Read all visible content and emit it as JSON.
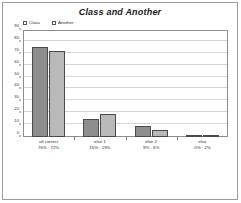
{
  "chart_data": {
    "type": "bar",
    "title": "Class and Another",
    "xlabel": "",
    "ylabel": "",
    "ylim": [
      0,
      90
    ],
    "ytick_step": 10,
    "yticks": [
      "0",
      "10",
      "20",
      "30",
      "40",
      "50",
      "60",
      "70",
      "80",
      "90"
    ],
    "grid": true,
    "legend_position": "top-left",
    "categories": [
      "all correct",
      "else 1",
      "else 2",
      "else"
    ],
    "category_sublabels": [
      "76% : 72%",
      "15% : 19%",
      "9% : 6%",
      "0% : 2%"
    ],
    "series": [
      {
        "name": "Class",
        "values": [
          76,
          15,
          9,
          0
        ],
        "color": "#8e8e8e"
      },
      {
        "name": "Another",
        "values": [
          72,
          19,
          6,
          2
        ],
        "color": "#b9b9b9"
      }
    ]
  },
  "colors": {
    "series_class": "#8e8e8e",
    "series_another": "#b9b9b9",
    "bar_outline": "#4a4a4a",
    "axis": "#8d8d8d",
    "gridline": "#d4d4d4",
    "page_border": "#9a9a9a",
    "text": "#2a2a2a",
    "background": "#ffffff"
  }
}
